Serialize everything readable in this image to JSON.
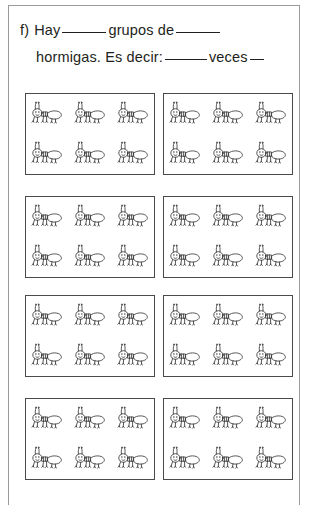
{
  "worksheet": {
    "item_letter": "f)",
    "line1": {
      "text_before": "Hay",
      "blank1": "",
      "text_middle": "grupos de",
      "blank2": ""
    },
    "line2": {
      "text_before": "hormigas. Es decir:",
      "blank1": "",
      "text_middle": "veces",
      "blank2": ""
    },
    "full_line1": "f) Hay ______ grupos de ______",
    "full_line2": "hormigas. Es decir: ______ veces __"
  },
  "groups": {
    "rows": 4,
    "columns": 2,
    "total_boxes": 8,
    "ants_per_box": 6,
    "ant_rows_per_box": 2,
    "ant_columns_per_box": 3,
    "total_ants": 48,
    "icon": "ant-icon",
    "boxes": [
      {
        "id": "group-1",
        "ant_count": 6
      },
      {
        "id": "group-2",
        "ant_count": 6
      },
      {
        "id": "group-3",
        "ant_count": 6
      },
      {
        "id": "group-4",
        "ant_count": 6
      },
      {
        "id": "group-5",
        "ant_count": 6
      },
      {
        "id": "group-6",
        "ant_count": 6
      },
      {
        "id": "group-7",
        "ant_count": 6
      },
      {
        "id": "group-8",
        "ant_count": 6
      }
    ]
  },
  "colors": {
    "page_background": "#ffffff",
    "page_border": "#9a9a9a",
    "box_border": "#4a4a4a",
    "text": "#231f20",
    "line_art": "#3a3a3a"
  }
}
